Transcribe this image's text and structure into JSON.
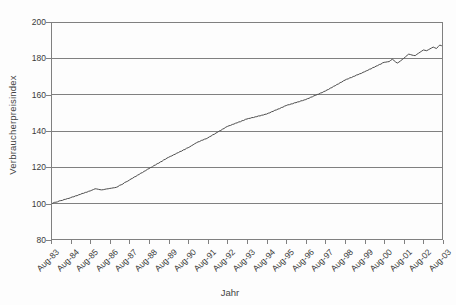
{
  "figure": {
    "background": "#fdfdfd",
    "colors": {
      "series_line": "#4d4d4d",
      "gridline": "#808080",
      "plot_border": "#808080",
      "text": "#3a3a3a"
    }
  },
  "chart_data": {
    "type": "line",
    "title": "",
    "xlabel": "Jahr",
    "ylabel": "Verbraucherpreisindex",
    "ylim": [
      80,
      200
    ],
    "yticks": [
      200,
      180,
      160,
      140,
      120,
      100,
      80
    ],
    "grid": "horizontal",
    "legend": "none",
    "x_tick_labels": [
      "Aug-83",
      "Aug-84",
      "Aug-85",
      "Aug-86",
      "Aug-87",
      "Aug-88",
      "Aug-89",
      "Aug-90",
      "Aug-91",
      "Aug-92",
      "Aug-93",
      "Aug-94",
      "Aug-95",
      "Aug-96",
      "Aug-97",
      "Aug-98",
      "Aug-99",
      "Aug-00",
      "Aug-01",
      "Aug-02",
      "Aug-03"
    ],
    "frequency": "monthly",
    "series": [
      {
        "name": "Verbraucherpreisindex",
        "color": "#4d4d4d",
        "values": [
          100.0,
          100.2,
          100.7,
          100.8,
          101.0,
          101.5,
          101.7,
          101.8,
          102.3,
          102.4,
          102.8,
          102.9,
          103.3,
          103.7,
          103.8,
          104.3,
          104.4,
          104.9,
          105.1,
          105.6,
          105.7,
          106.2,
          106.3,
          106.8,
          107.0,
          107.4,
          107.8,
          108.2,
          108.1,
          107.9,
          107.7,
          107.6,
          107.7,
          107.9,
          108.1,
          108.2,
          108.4,
          108.5,
          108.7,
          108.8,
          109.0,
          109.4,
          110.1,
          110.4,
          110.8,
          111.6,
          112.0,
          112.4,
          113.0,
          113.6,
          114.0,
          114.7,
          115.0,
          115.7,
          116.1,
          116.8,
          117.1,
          117.8,
          118.2,
          118.9,
          119.3,
          119.9,
          120.2,
          121.0,
          121.3,
          122.0,
          122.3,
          123.0,
          123.3,
          124.1,
          124.4,
          125.1,
          125.5,
          126.0,
          126.3,
          126.9,
          127.2,
          127.8,
          128.1,
          128.7,
          128.9,
          129.6,
          129.8,
          130.5,
          130.8,
          131.3,
          131.9,
          132.4,
          133.0,
          133.5,
          134.0,
          134.2,
          134.8,
          135.0,
          135.5,
          135.7,
          136.2,
          136.8,
          137.2,
          137.9,
          138.2,
          138.9,
          139.3,
          140.0,
          140.3,
          141.0,
          141.4,
          142.1,
          142.5,
          142.9,
          143.1,
          143.6,
          143.8,
          144.3,
          144.5,
          145.0,
          145.1,
          145.7,
          145.8,
          146.4,
          146.6,
          146.9,
          147.0,
          147.4,
          147.4,
          147.8,
          147.9,
          148.3,
          148.3,
          148.7,
          148.8,
          149.2,
          149.3,
          149.8,
          150.0,
          150.6,
          150.8,
          151.4,
          151.6,
          152.1,
          152.3,
          152.9,
          153.1,
          153.7,
          154.0,
          154.4,
          154.5,
          154.9,
          155.0,
          155.5,
          155.6,
          156.0,
          156.1,
          156.6,
          156.7,
          157.1,
          157.3,
          157.8,
          158.0,
          158.6,
          158.8,
          159.4,
          159.6,
          160.1,
          160.3,
          160.9,
          161.1,
          161.7,
          162.0,
          162.6,
          162.9,
          163.6,
          163.9,
          164.6,
          164.9,
          165.6,
          165.9,
          166.6,
          166.9,
          167.6,
          168.0,
          168.5,
          168.7,
          169.3,
          169.4,
          170.0,
          170.2,
          170.8,
          171.0,
          171.5,
          171.7,
          172.3,
          172.6,
          173.1,
          173.4,
          174.0,
          174.2,
          174.9,
          175.1,
          175.7,
          176.0,
          176.6,
          176.8,
          177.5,
          177.8,
          177.9,
          178.1,
          178.2,
          178.9,
          179.5,
          178.8,
          178.0,
          177.4,
          177.9,
          178.6,
          179.3,
          180.0,
          180.8,
          181.6,
          182.3,
          182.1,
          181.8,
          181.6,
          181.5,
          182.2,
          182.8,
          183.4,
          184.0,
          184.6,
          184.4,
          184.2,
          184.7,
          185.2,
          185.7,
          186.2,
          185.8,
          185.4,
          186.4,
          187.3,
          187.0,
          186.6
        ]
      }
    ]
  }
}
